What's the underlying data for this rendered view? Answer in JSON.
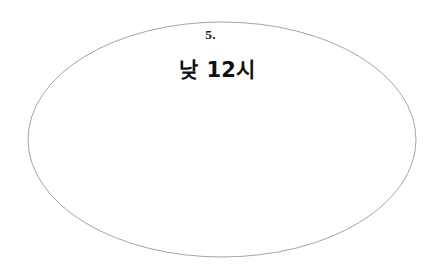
{
  "canvas": {
    "width": 437,
    "height": 277,
    "background_color": "#ffffff"
  },
  "shape": {
    "kind": "ellipse-icon",
    "center_x": 222,
    "center_y": 139.5,
    "radius_x": 194,
    "radius_y": 117.5,
    "stroke_color": "#a6a6a6",
    "stroke_width": 1,
    "fill_color": "#ffffff"
  },
  "content": {
    "item_number": "5.",
    "main_label": "낮 12시",
    "text_color": "#111111"
  }
}
